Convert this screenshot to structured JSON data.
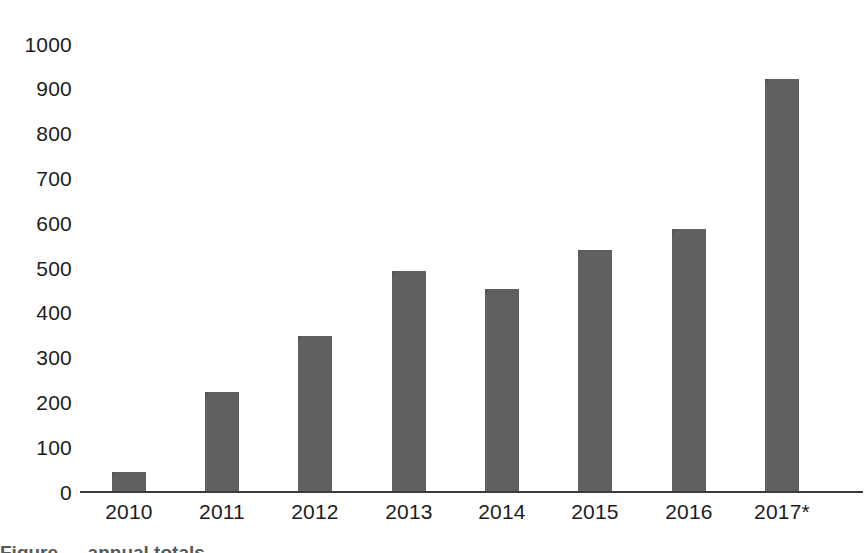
{
  "chart_data": {
    "type": "bar",
    "title": "",
    "subtitle": "",
    "xlabel": "",
    "ylabel": "",
    "categories": [
      "2010",
      "2011",
      "2012",
      "2013",
      "2014",
      "2015",
      "2016",
      "2017*"
    ],
    "values": [
      43,
      220,
      345,
      490,
      450,
      538,
      585,
      920
    ],
    "ylim": [
      0,
      1000
    ],
    "yticks": [
      "0",
      "100",
      "200",
      "300",
      "400",
      "500",
      "600",
      "700",
      "800",
      "900",
      "1000"
    ],
    "ytick_values": [
      0,
      100,
      200,
      300,
      400,
      500,
      600,
      700,
      800,
      900,
      1000
    ],
    "grid": false,
    "legend": [],
    "legend_position": "none",
    "annotations": [
      "2017* denotes a projected or preliminary value"
    ],
    "series": [
      {
        "name": "",
        "values": [
          43,
          220,
          345,
          490,
          450,
          538,
          585,
          920
        ]
      }
    ],
    "colors": {
      "bar_fill": "#5b5b5b",
      "axis_line": "#3a3a3a",
      "text": "#1c1c1c",
      "background": "#ffffff"
    }
  },
  "caption": {
    "fragment": "Figure — annual totals"
  }
}
